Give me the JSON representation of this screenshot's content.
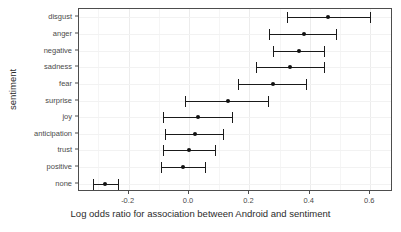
{
  "chart_data": {
    "type": "scatter",
    "orientation": "horizontal",
    "title": "",
    "xlabel": "Log odds ratio for association between Android and sentiment",
    "ylabel": "sentiment",
    "xlim": [
      -0.33,
      0.7
    ],
    "ylim_categories": [
      "disgust",
      "anger",
      "negative",
      "sadness",
      "fear",
      "surprise",
      "joy",
      "anticipation",
      "trust",
      "positive",
      "none"
    ],
    "xticks": [
      -0.2,
      0.0,
      0.2,
      0.4,
      0.6
    ],
    "xticklabels": [
      "-0.2",
      "0.0",
      "0.2",
      "0.4",
      "0.6"
    ],
    "grid": true,
    "legend": false,
    "categories": [
      "disgust",
      "anger",
      "negative",
      "sadness",
      "fear",
      "surprise",
      "joy",
      "anticipation",
      "trust",
      "positive",
      "none"
    ],
    "values": [
      0.46,
      0.38,
      0.365,
      0.335,
      0.278,
      0.13,
      0.03,
      0.02,
      0.0,
      -0.02,
      -0.278
    ],
    "error_low": [
      0.325,
      0.265,
      0.278,
      0.222,
      0.162,
      -0.013,
      -0.086,
      -0.08,
      -0.086,
      -0.093,
      -0.318
    ],
    "error_high": [
      0.6,
      0.487,
      0.447,
      0.447,
      0.387,
      0.26,
      0.142,
      0.113,
      0.086,
      0.053,
      -0.235
    ],
    "points": [
      {
        "label": "disgust",
        "value": 0.46,
        "low": 0.325,
        "high": 0.6
      },
      {
        "label": "anger",
        "value": 0.38,
        "low": 0.265,
        "high": 0.487
      },
      {
        "label": "negative",
        "value": 0.365,
        "low": 0.278,
        "high": 0.447
      },
      {
        "label": "sadness",
        "value": 0.335,
        "low": 0.222,
        "high": 0.447
      },
      {
        "label": "fear",
        "value": 0.278,
        "low": 0.162,
        "high": 0.387
      },
      {
        "label": "surprise",
        "value": 0.13,
        "low": -0.013,
        "high": 0.26
      },
      {
        "label": "joy",
        "value": 0.03,
        "low": -0.086,
        "high": 0.142
      },
      {
        "label": "anticipation",
        "value": 0.02,
        "low": -0.08,
        "high": 0.113
      },
      {
        "label": "trust",
        "value": 0.0,
        "low": -0.086,
        "high": 0.086
      },
      {
        "label": "positive",
        "value": -0.02,
        "low": -0.093,
        "high": 0.053
      },
      {
        "label": "none",
        "value": -0.278,
        "low": -0.318,
        "high": -0.235
      }
    ],
    "colors": {
      "point": "#111111",
      "interval": "#1a1a1a",
      "panel_border": "#4d4d4d",
      "gridline": "#ececec",
      "background": "#ffffff",
      "text": "#4a4a4a"
    }
  }
}
